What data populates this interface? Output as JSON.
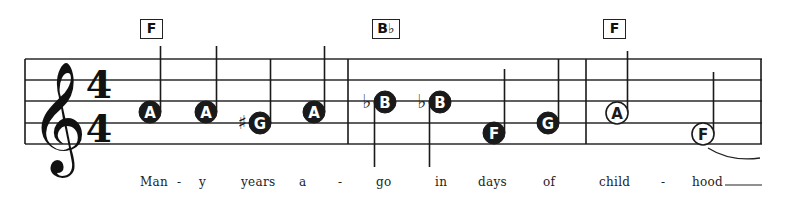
{
  "time_signature": {
    "top": "4",
    "bottom": "4"
  },
  "clef": "treble-clef",
  "chords": [
    {
      "label": "F",
      "x": 140,
      "w": 23
    },
    {
      "label": "B♭",
      "x": 372,
      "w": 28
    },
    {
      "label": "F",
      "x": 603,
      "w": 23
    }
  ],
  "notes": [
    {
      "letter": "A",
      "x": 150,
      "y": 112,
      "filled": true,
      "accidental": "",
      "stem": "up",
      "stem_end": 46
    },
    {
      "letter": "A",
      "x": 206,
      "y": 112,
      "filled": true,
      "accidental": "",
      "stem": "up",
      "stem_end": 46
    },
    {
      "letter": "G",
      "x": 260,
      "y": 123,
      "filled": true,
      "accidental": "♯",
      "stem": "up",
      "stem_end": 59
    },
    {
      "letter": "A",
      "x": 314,
      "y": 112,
      "filled": true,
      "accidental": "",
      "stem": "up",
      "stem_end": 46
    },
    {
      "letter": "B",
      "x": 385,
      "y": 102,
      "filled": true,
      "accidental": "♭",
      "stem": "down",
      "stem_end": 167
    },
    {
      "letter": "B",
      "x": 440,
      "y": 102,
      "filled": true,
      "accidental": "♭",
      "stem": "down",
      "stem_end": 167
    },
    {
      "letter": "F",
      "x": 494,
      "y": 133,
      "filled": true,
      "accidental": "",
      "stem": "up",
      "stem_end": 69
    },
    {
      "letter": "G",
      "x": 548,
      "y": 123,
      "filled": true,
      "accidental": "",
      "stem": "up",
      "stem_end": 59
    },
    {
      "letter": "A",
      "x": 617,
      "y": 113,
      "filled": false,
      "accidental": "",
      "stem": "up",
      "stem_end": 51
    },
    {
      "letter": "F",
      "x": 703,
      "y": 134,
      "filled": false,
      "accidental": "",
      "stem": "up",
      "stem_end": 72
    }
  ],
  "lyrics": [
    {
      "text": "Man",
      "x": 140
    },
    {
      "text": "-",
      "x": 177
    },
    {
      "text": "y",
      "x": 199
    },
    {
      "text": "years",
      "x": 241
    },
    {
      "text": "a",
      "x": 299
    },
    {
      "text": "-",
      "x": 338
    },
    {
      "text": "go",
      "x": 376
    },
    {
      "text": "in",
      "x": 435
    },
    {
      "text": "days",
      "x": 478
    },
    {
      "text": "of",
      "x": 543
    },
    {
      "text": "child",
      "x": 599
    },
    {
      "text": "-",
      "x": 661
    },
    {
      "text": "hood",
      "x": 692
    }
  ],
  "colors": {
    "ink": "#1a1a1a",
    "paper": "#ffffff",
    "note_letter": "#ffffff"
  }
}
